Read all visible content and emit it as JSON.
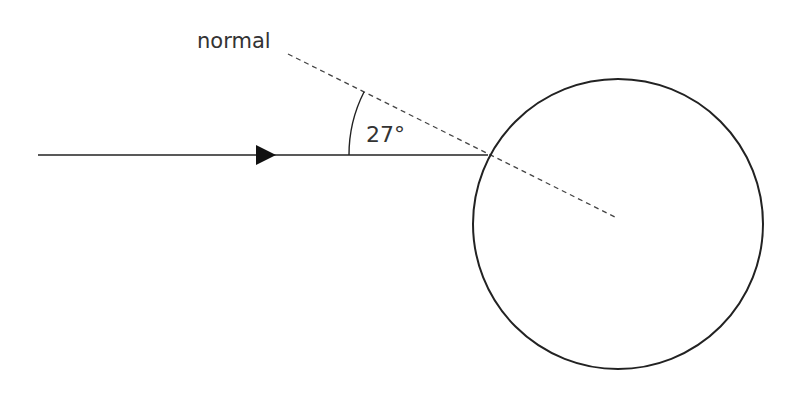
{
  "diagram": {
    "labels": {
      "normal": "normal",
      "angle": "27°"
    },
    "colors": {
      "stroke": "#222222",
      "dashed": "#444444",
      "text": "#333333",
      "background": "#ffffff"
    },
    "incident_ray": {
      "x1": 38,
      "y1": 155,
      "x2": 488,
      "y2": 155
    },
    "arrowhead": {
      "tip_x": 276,
      "y": 155
    },
    "normal_line": {
      "x1": 288,
      "y1": 54,
      "x2": 617,
      "y2": 218
    },
    "circle": {
      "cx": 618,
      "cy": 224,
      "r": 145
    },
    "angle_degrees": 27
  }
}
